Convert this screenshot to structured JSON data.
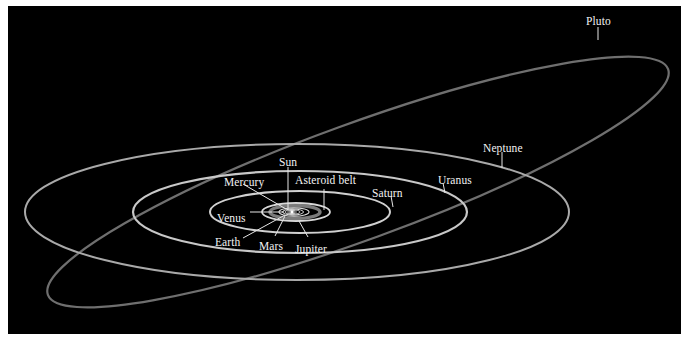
{
  "diagram": {
    "background": "#000000",
    "orbit_color": "#cfcfcf",
    "pluto_orbit_color": "#7a7a7a",
    "labels": {
      "sun": "Sun",
      "mercury": "Mercury",
      "venus": "Venus",
      "earth": "Earth",
      "mars": "Mars",
      "asteroid_belt": "Asteroid belt",
      "jupiter": "Jupiter",
      "saturn": "Saturn",
      "uranus": "Uranus",
      "neptune": "Neptune",
      "pluto": "Pluto"
    }
  }
}
